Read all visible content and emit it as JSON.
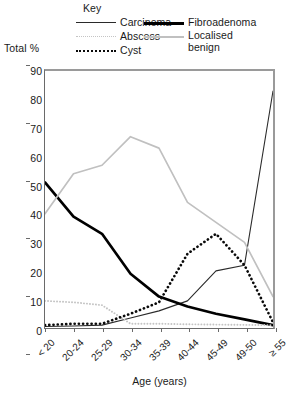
{
  "legend": {
    "title": "Key",
    "entries": [
      {
        "label": "Carcinoma",
        "style": "thin-solid-black",
        "color": "#2a2a2a"
      },
      {
        "label": "Fibroadenoma",
        "style": "thick-solid-black",
        "color": "#000000"
      },
      {
        "label": "Abscess",
        "style": "fine-dotted-gray",
        "color": "#c4c4c4"
      },
      {
        "label": "Localised benign",
        "style": "solid-light-gray",
        "color": "#c0c0c0"
      },
      {
        "label": "Cyst",
        "style": "bold-dotted-black",
        "color": "#0a0a0a"
      }
    ]
  },
  "axes": {
    "y_title": "Total %",
    "x_title": "Age (years)",
    "y_ticks": [
      "0",
      "10",
      "20",
      "30",
      "40",
      "50",
      "60",
      "70",
      "80",
      "90"
    ],
    "x_ticks": [
      "< 20",
      "20-24",
      "25-29",
      "30-34",
      "35-39",
      "40-44",
      "45-49",
      "49-50",
      "≥ 55"
    ]
  },
  "chart_data": {
    "type": "line",
    "title": "",
    "xlabel": "Age (years)",
    "ylabel": "Total %",
    "ylim": [
      0,
      90
    ],
    "grid": false,
    "legend_position": "top",
    "legend_title": "Key",
    "categories": [
      "< 20",
      "20-24",
      "25-29",
      "30-34",
      "35-39",
      "40-44",
      "45-49",
      "49-50",
      "≥ 55"
    ],
    "series": [
      {
        "name": "Carcinoma",
        "color": "#2a2a2a",
        "style": "solid",
        "width": 1.1,
        "values": [
          0.5,
          0.7,
          1.0,
          3.5,
          6.0,
          9.5,
          20.0,
          22.0,
          83.0
        ]
      },
      {
        "name": "Fibroadenoma",
        "color": "#000000",
        "style": "solid",
        "width": 2.7,
        "values": [
          51.0,
          39.0,
          33.0,
          19.0,
          11.0,
          7.5,
          5.0,
          3.0,
          1.0
        ]
      },
      {
        "name": "Abscess",
        "color": "#c4c4c4",
        "style": "dotted",
        "width": 1.9,
        "values": [
          9.5,
          9.0,
          8.0,
          1.5,
          1.5,
          1.3,
          1.2,
          1.1,
          1.0
        ]
      },
      {
        "name": "Localised benign",
        "color": "#c0c0c0",
        "style": "solid",
        "width": 1.7,
        "values": [
          40.0,
          54.0,
          57.0,
          67.0,
          63.0,
          44.0,
          37.0,
          30.0,
          11.0
        ]
      },
      {
        "name": "Cyst",
        "color": "#0a0a0a",
        "style": "dotted",
        "width": 2.7,
        "values": [
          1.0,
          1.5,
          1.5,
          5.0,
          9.0,
          26.0,
          33.0,
          22.0,
          2.0
        ]
      }
    ]
  }
}
